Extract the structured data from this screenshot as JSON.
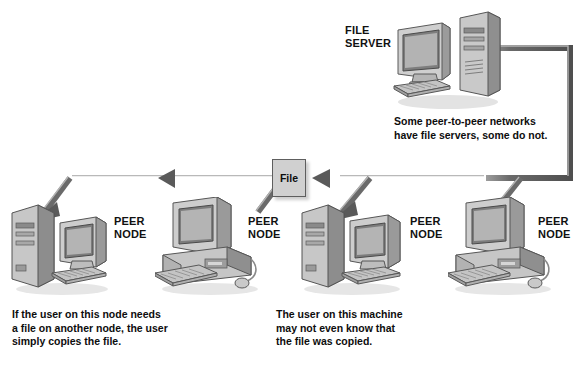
{
  "diagram": {
    "background_color": "#ffffff",
    "line_color": "#6a6a6a",
    "line_highlight": "#b8b8b8"
  },
  "file_box": {
    "label": "File",
    "fill": "#d0d0d0",
    "border": "#5e5e5e"
  },
  "server": {
    "label": "FILE\nSERVER",
    "caption": "Some peer-to-peer networks\nhave file servers, some do not."
  },
  "nodes": [
    {
      "id": "node-1",
      "label": "PEER\nNODE",
      "type": "tower-and-monitor"
    },
    {
      "id": "node-2",
      "label": "PEER\nNODE",
      "type": "desktop-case"
    },
    {
      "id": "node-3",
      "label": "PEER\nNODE",
      "type": "tower-and-monitor"
    },
    {
      "id": "node-4",
      "label": "PEER\nNODE",
      "type": "desktop-case"
    }
  ],
  "captions": {
    "left": "If the user on this node needs\na file on another node, the user\nsimply copies the file.",
    "right": "The user on this machine\nmay not even know that\nthe file was copied."
  }
}
